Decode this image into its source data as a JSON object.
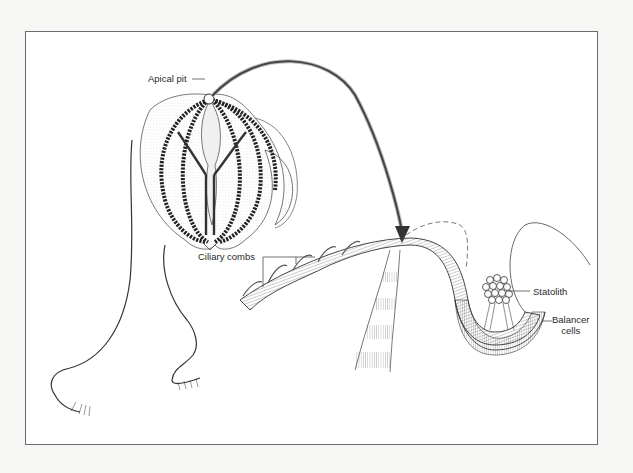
{
  "figure": {
    "labels": {
      "apical_pit": "Apical pit",
      "ciliary_combs": "Ciliary combs",
      "statolith": "Statolith",
      "balancer_cells_line1": "Balancer",
      "balancer_cells_line2": "cells"
    },
    "colors": {
      "ink": "#2a2a2a",
      "frame": "#6a6a6a",
      "background": "#ffffff"
    }
  }
}
